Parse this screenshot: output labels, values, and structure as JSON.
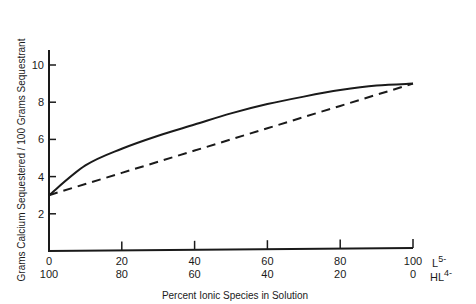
{
  "chart_data": {
    "type": "line",
    "title": "",
    "xlabel": "Percent Ionic Species in Solution",
    "ylabel": "Grams Calcium Sequestered / 100 Grams Sequestrant",
    "xlim": [
      0,
      100
    ],
    "ylim": [
      0,
      10.5
    ],
    "grid": false,
    "legend": null,
    "x_ticks_primary": [
      "0",
      "20",
      "40",
      "60",
      "80",
      "100"
    ],
    "x_ticks_secondary": [
      "100",
      "80",
      "60",
      "40",
      "20",
      "0"
    ],
    "x_primary_species": "L",
    "x_primary_species_charge": "5-",
    "x_secondary_species": "HL",
    "x_secondary_species_charge": "4-",
    "y_ticks": [
      "2",
      "4",
      "6",
      "8",
      "10"
    ],
    "x": [
      0,
      10,
      20,
      30,
      40,
      50,
      60,
      70,
      80,
      90,
      100
    ],
    "series": [
      {
        "name": "Observed (solid)",
        "style": "solid",
        "values": [
          3.0,
          4.6,
          5.5,
          6.2,
          6.8,
          7.4,
          7.9,
          8.3,
          8.65,
          8.9,
          9.0
        ]
      },
      {
        "name": "Linear (dashed)",
        "style": "dashed",
        "values": [
          3.0,
          3.6,
          4.2,
          4.8,
          5.4,
          6.0,
          6.6,
          7.2,
          7.8,
          8.4,
          9.0
        ]
      }
    ]
  }
}
